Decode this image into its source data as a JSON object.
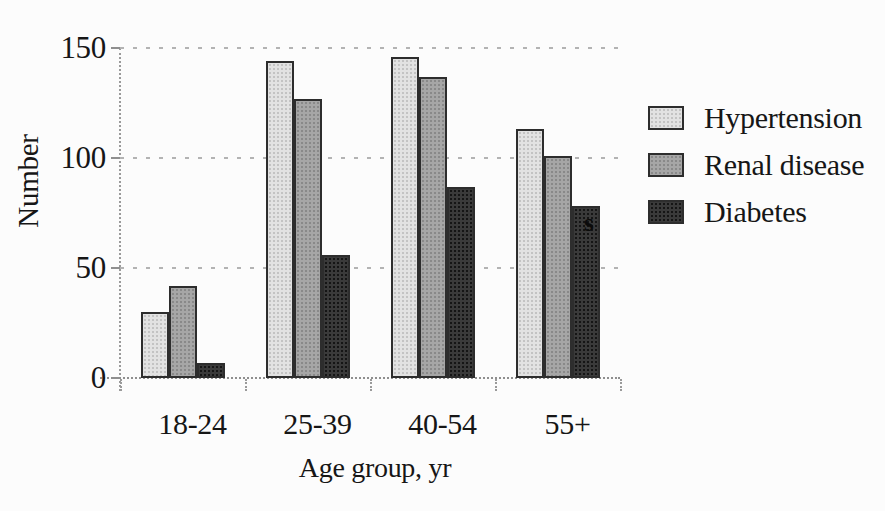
{
  "figure": {
    "background": "#fcfcfc",
    "text_color": "#161616",
    "axis_color": "#8f8f8f",
    "bar_border_color": "#2d2d2d"
  },
  "chart_data": {
    "type": "bar",
    "title": "",
    "categories": [
      "18-24",
      "25-39",
      "40-54",
      "55+"
    ],
    "series": [
      {
        "name": "Hypertension",
        "values": [
          30,
          144,
          146,
          113
        ],
        "color": "#e2e2e2",
        "dot_color": "#c3c3c3"
      },
      {
        "name": "Renal disease",
        "values": [
          42,
          127,
          137,
          101
        ],
        "color": "#a6a6a6",
        "dot_color": "#898989"
      },
      {
        "name": "Diabetes",
        "values": [
          7,
          56,
          87,
          78
        ],
        "color": "#3a3a3a",
        "dot_color": "#151515"
      }
    ],
    "xlabel": "Age group, yr",
    "ylabel": "Number",
    "ylim": [
      0,
      150
    ],
    "yticks": [
      150,
      100,
      50,
      0
    ],
    "grid": "horizontal dotted gridlines at 50, 100, 150",
    "legend_position": "right",
    "legend": [
      "Hypertension",
      "Renal disease",
      "Diabetes"
    ],
    "annotation": {
      "text": "s",
      "location": "on Diabetes bar of 55+ age group"
    }
  }
}
